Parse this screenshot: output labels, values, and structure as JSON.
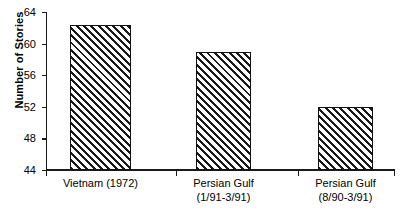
{
  "chart_data": {
    "type": "bar",
    "title": "",
    "xlabel": "",
    "ylabel": "Number of Stories",
    "categories": [
      "Vietnam (1972)",
      "Persian Gulf (1/91-3/91)",
      "Persian Gulf (8/90-3/91)"
    ],
    "category_lines": [
      [
        "Vietnam (1972)",
        ""
      ],
      [
        "Persian Gulf",
        "(1/91-3/91)"
      ],
      [
        "Persian Gulf",
        "(8/90-3/91)"
      ]
    ],
    "values": [
      62.3,
      59.0,
      52.0
    ],
    "ylim": [
      44,
      64
    ],
    "yticks": [
      44,
      48,
      52,
      56,
      60,
      64
    ],
    "ytick_labels": [
      "44",
      "48",
      "52",
      "56",
      "60",
      "64"
    ],
    "grid": false,
    "legend": null,
    "bar_fill": "diagonal-hatch",
    "colors": {
      "axis": "#1a1a1a",
      "bar_outline": "#111111",
      "bar_hatch": "#1a1a1a",
      "background": "#ffffff"
    }
  }
}
